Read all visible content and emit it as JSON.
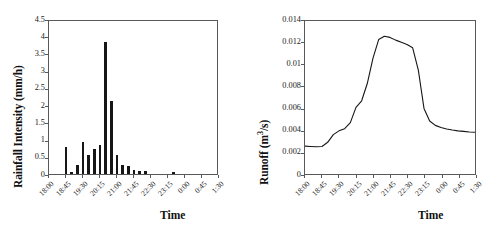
{
  "figure": {
    "panels": [
      "rainfall",
      "runoff"
    ],
    "background": "#ffffff",
    "ink": "#161616"
  },
  "chart_data": [
    {
      "id": "rainfall",
      "type": "bar",
      "title": "",
      "xlabel": "Time",
      "ylabel": "Rainfall Intensity (mm/h)",
      "ylabel_text": "Rainfall Intensity (mm/h)",
      "ylim": [
        0,
        4.5
      ],
      "yticks": [
        "0",
        "0.5",
        "1",
        "1.5",
        "2",
        "2.5",
        "3",
        "3.5",
        "4",
        "4.5"
      ],
      "ytick_values": [
        0,
        0.5,
        1,
        1.5,
        2,
        2.5,
        3,
        3.5,
        4,
        4.5
      ],
      "xticks": [
        "18:00",
        "18:45",
        "19:30",
        "20:15",
        "21:00",
        "21:45",
        "22:30",
        "23:15",
        "0:00",
        "0:45",
        "1:30"
      ],
      "grid": false,
      "legend": null,
      "bar_interval_minutes": 15,
      "categories": [
        "18:00",
        "18:15",
        "18:30",
        "18:45",
        "19:00",
        "19:15",
        "19:30",
        "19:45",
        "20:00",
        "20:15",
        "20:30",
        "20:45",
        "21:00",
        "21:15",
        "21:30",
        "21:45",
        "22:00",
        "22:15",
        "22:30",
        "22:45",
        "23:00",
        "23:15",
        "23:30",
        "23:45",
        "0:00",
        "0:15",
        "0:30",
        "0:45",
        "1:00",
        "1:15",
        "1:30"
      ],
      "values": [
        0,
        0,
        0,
        0.78,
        0.05,
        0.25,
        0.94,
        0.55,
        0.72,
        0.85,
        3.84,
        2.13,
        0.55,
        0.26,
        0.22,
        0.13,
        0.08,
        0.09,
        0,
        0,
        0,
        0,
        0.06,
        0,
        0,
        0,
        0,
        0,
        0,
        0,
        0
      ]
    },
    {
      "id": "runoff",
      "type": "line",
      "title": "",
      "xlabel": "Time",
      "ylabel": "Runoff (m3/s)",
      "ylabel_prefix": "Runoff (m",
      "ylabel_sup": "3",
      "ylabel_suffix": "/s)",
      "ylim": [
        0,
        0.014
      ],
      "yticks": [
        "0",
        "0.002",
        "0.004",
        "0.006",
        "0.008",
        "0.01",
        "0.012",
        "0.014"
      ],
      "ytick_values": [
        0,
        0.002,
        0.004,
        0.006,
        0.008,
        0.01,
        0.012,
        0.014
      ],
      "xticks": [
        "18:00",
        "18:45",
        "19:30",
        "20:15",
        "21:00",
        "21:45",
        "22:30",
        "23:15",
        "0:00",
        "0:45",
        "1:30"
      ],
      "grid": false,
      "legend": null,
      "x": [
        "18:00",
        "18:15",
        "18:30",
        "18:45",
        "19:00",
        "19:15",
        "19:30",
        "19:45",
        "20:00",
        "20:15",
        "20:30",
        "20:45",
        "21:00",
        "21:15",
        "21:30",
        "21:45",
        "22:00",
        "22:15",
        "22:30",
        "22:45",
        "23:00",
        "23:15",
        "23:30",
        "23:45",
        "0:00",
        "0:15",
        "0:30",
        "0:45",
        "1:00",
        "1:15",
        "1:30"
      ],
      "values": [
        0.00255,
        0.00252,
        0.0025,
        0.00252,
        0.0029,
        0.0036,
        0.00395,
        0.00415,
        0.0047,
        0.0061,
        0.0067,
        0.0083,
        0.0106,
        0.0123,
        0.0126,
        0.0125,
        0.01225,
        0.01205,
        0.01185,
        0.01155,
        0.0095,
        0.006,
        0.00485,
        0.00445,
        0.00425,
        0.00412,
        0.00402,
        0.00395,
        0.0039,
        0.00385,
        0.00382
      ]
    }
  ]
}
